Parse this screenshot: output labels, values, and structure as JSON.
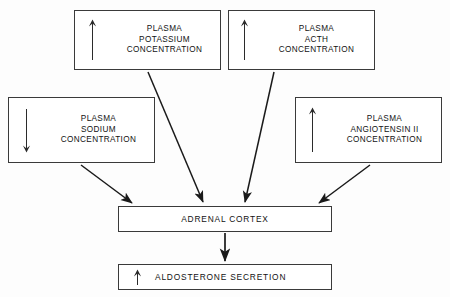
{
  "diagram": {
    "background_color": "#fdfdfd",
    "line_color": "#1a1a1a",
    "box_border_color": "#3a3a3a",
    "text_color": "#121212",
    "nodes": [
      {
        "id": "potassium",
        "label": "PLASMA\nPOTASSIUM\nCONCENTRATION",
        "arrow": "up-arrow-icon",
        "arrow_glyph": "↑"
      },
      {
        "id": "acth",
        "label": "PLASMA\nACTH\nCONCENTRATION",
        "arrow": "up-arrow-icon",
        "arrow_glyph": "↑"
      },
      {
        "id": "sodium",
        "label": "PLASMA\nSODIUM\nCONCENTRATION",
        "arrow": "down-arrow-icon",
        "arrow_glyph": "↓"
      },
      {
        "id": "angiotensin",
        "label": "PLASMA\nANGIOTENSIN II\nCONCENTRATION",
        "arrow": "up-arrow-icon",
        "arrow_glyph": "↑"
      },
      {
        "id": "adrenal",
        "label": "ADRENAL CORTEX",
        "arrow": "none",
        "arrow_glyph": ""
      },
      {
        "id": "aldosterone",
        "label": "ALDOSTERONE SECRETION",
        "arrow": "up-arrow-icon",
        "arrow_glyph": "↑"
      }
    ],
    "connectors": [
      {
        "from": "sodium",
        "to": "adrenal",
        "style": "solid-arrow"
      },
      {
        "from": "potassium",
        "to": "adrenal",
        "style": "solid-arrow"
      },
      {
        "from": "acth",
        "to": "adrenal",
        "style": "solid-arrow"
      },
      {
        "from": "angiotensin",
        "to": "adrenal",
        "style": "solid-arrow"
      },
      {
        "from": "adrenal",
        "to": "aldosterone",
        "style": "solid-arrow"
      }
    ]
  }
}
